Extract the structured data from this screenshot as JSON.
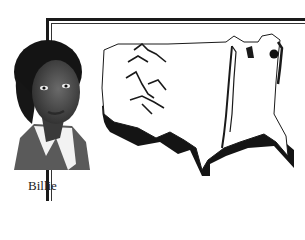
{
  "person": {
    "name": "Billie",
    "image": "portrait-photo"
  },
  "map": {
    "region": "united-states-outline",
    "marker": "location-dot"
  },
  "colors": {
    "ink": "#1a1a1a",
    "background": "#ffffff"
  }
}
